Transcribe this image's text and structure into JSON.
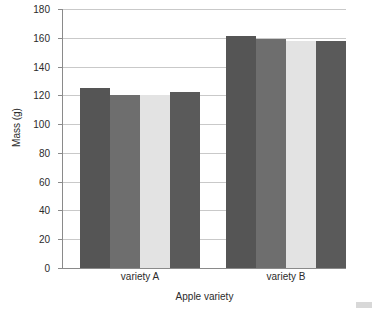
{
  "chart_data": {
    "type": "bar",
    "title": "",
    "xlabel": "Apple variety",
    "ylabel": "Mass (g)",
    "ylim": [
      0,
      180
    ],
    "ytick_step": 20,
    "yticks": [
      0,
      20,
      40,
      60,
      80,
      100,
      120,
      140,
      160,
      180
    ],
    "grid": true,
    "legend": "none",
    "categories": [
      "variety A",
      "variety B"
    ],
    "series": [
      {
        "name": "bar 1",
        "color": "#555555",
        "values": [
          125,
          161
        ]
      },
      {
        "name": "bar 2",
        "color": "#6e6e6e",
        "values": [
          120,
          159
        ]
      },
      {
        "name": "bar 3",
        "color": "#e3e3e3",
        "values": [
          120,
          158
        ]
      },
      {
        "name": "bar 4",
        "color": "#5a5a5a",
        "values": [
          122,
          158
        ]
      }
    ],
    "bars": [
      {
        "group": "variety A",
        "index": 0,
        "value": 125,
        "color": "#555555"
      },
      {
        "group": "variety A",
        "index": 1,
        "value": 120,
        "color": "#6e6e6e"
      },
      {
        "group": "variety A",
        "index": 2,
        "value": 120,
        "color": "#e3e3e3"
      },
      {
        "group": "variety A",
        "index": 3,
        "value": 122,
        "color": "#5a5a5a"
      },
      {
        "group": "variety B",
        "index": 0,
        "value": 161,
        "color": "#555555"
      },
      {
        "group": "variety B",
        "index": 1,
        "value": 159,
        "color": "#6e6e6e"
      },
      {
        "group": "variety B",
        "index": 2,
        "value": 158,
        "color": "#e3e3e3"
      },
      {
        "group": "variety B",
        "index": 3,
        "value": 158,
        "color": "#5a5a5a"
      }
    ]
  },
  "axes": {
    "y_title": "Mass (g)",
    "x_title": "Apple variety",
    "y_tick_labels": [
      "180",
      "160",
      "140",
      "120",
      "100",
      "80",
      "60",
      "40",
      "20",
      "0"
    ],
    "x_tick_labels": [
      "variety A",
      "variety B"
    ]
  },
  "colors": {
    "axis": "#8a8a8a",
    "grid": "#c9c9c9",
    "text": "#2b2b2b",
    "background": "#ffffff",
    "bar_dark": "#555555",
    "bar_medium": "#6e6e6e",
    "bar_light": "#e3e3e3",
    "bar_dark2": "#5a5a5a"
  }
}
